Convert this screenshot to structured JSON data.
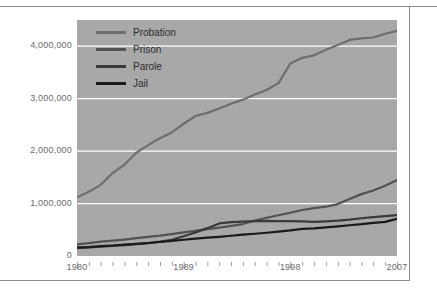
{
  "chart_data": {
    "type": "line",
    "title": "",
    "xlabel": "",
    "ylabel": "",
    "xlim": [
      1980,
      2007
    ],
    "ylim": [
      0,
      4500000
    ],
    "grid": true,
    "legend_position": "top-left",
    "x_tick_labels": [
      "1980",
      "1989",
      "1998",
      "2007"
    ],
    "x_tick_values": [
      1980,
      1989,
      1998,
      2007
    ],
    "y_tick_labels": [
      "0",
      "1,000,000",
      "2,000,000",
      "3,000,000",
      "4,000,000"
    ],
    "y_tick_values": [
      0,
      1000000,
      2000000,
      3000000,
      4000000
    ],
    "x": [
      1980,
      1981,
      1982,
      1983,
      1984,
      1985,
      1986,
      1987,
      1988,
      1989,
      1990,
      1991,
      1992,
      1993,
      1994,
      1995,
      1996,
      1997,
      1998,
      1999,
      2000,
      2001,
      2002,
      2003,
      2004,
      2005,
      2006,
      2007
    ],
    "series": [
      {
        "name": "Probation",
        "color": "#6e6e6e",
        "values": [
          1118000,
          1225000,
          1357000,
          1582000,
          1740000,
          1968000,
          2114000,
          2247000,
          2356000,
          2522000,
          2670000,
          2729000,
          2811000,
          2903000,
          2981000,
          3078000,
          3164000,
          3297000,
          3670000,
          3779000,
          3826000,
          3932000,
          4024000,
          4120000,
          4151000,
          4166000,
          4237000,
          4293000
        ]
      },
      {
        "name": "Prison",
        "color": "#525252",
        "values": [
          220000,
          244000,
          275000,
          295000,
          313000,
          340000,
          364000,
          387000,
          417000,
          452000,
          481000,
          512000,
          542000,
          573000,
          609000,
          677000,
          729000,
          777000,
          825000,
          877000,
          912000,
          940000,
          990000,
          1086000,
          1180000,
          1250000,
          1338000,
          1450000
        ]
      },
      {
        "name": "Parole",
        "color": "#3a3a3a",
        "values": [
          152000,
          163000,
          176000,
          191000,
          206000,
          228000,
          247000,
          273000,
          308000,
          377000,
          451000,
          531000,
          621000,
          646000,
          657000,
          664000,
          668000,
          666000,
          664000,
          659000,
          652000,
          662000,
          676000,
          695000,
          720000,
          742000,
          762000,
          780000
        ]
      },
      {
        "name": "Jail",
        "color": "#1a1a1a",
        "values": [
          163000,
          170000,
          187000,
          200000,
          215000,
          232000,
          248000,
          267000,
          288000,
          310000,
          332000,
          349000,
          365000,
          386000,
          407000,
          424000,
          443000,
          465000,
          488000,
          516000,
          528000,
          546000,
          564000,
          587000,
          607000,
          633000,
          651000,
          710000
        ]
      }
    ]
  },
  "legend": {
    "items": [
      {
        "label": "Probation",
        "color": "#6e6e6e"
      },
      {
        "label": "Prison",
        "color": "#525252"
      },
      {
        "label": "Parole",
        "color": "#3a3a3a"
      },
      {
        "label": "Jail",
        "color": "#1a1a1a"
      }
    ]
  },
  "style": {
    "plot_background": "#a8a8a8",
    "gridline_color": "#ffffff",
    "axis_text_color": "#6b6b6b",
    "frame_color": "#8c8c8c"
  }
}
